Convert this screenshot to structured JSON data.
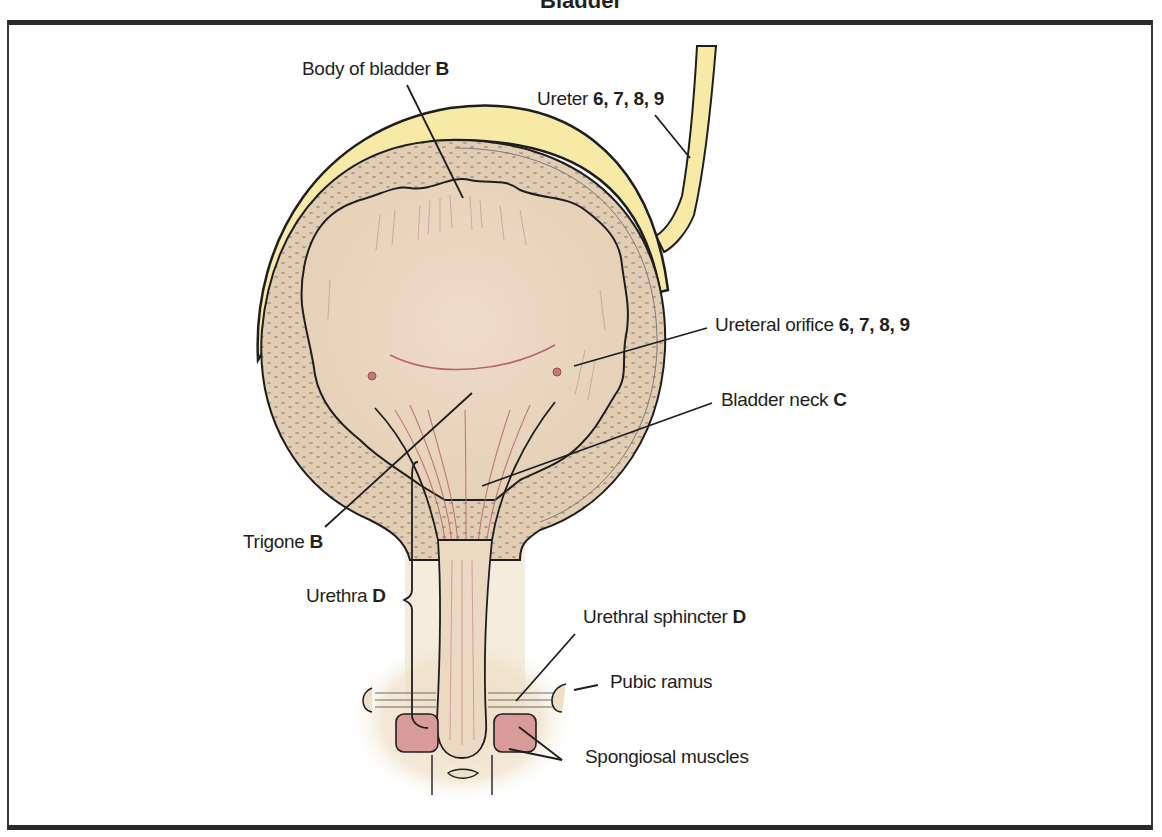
{
  "title": "Bladder",
  "colors": {
    "frame": "#2a2a2a",
    "peritoneum": "#f7e9a6",
    "bladder_wall": "#ead8c3",
    "mucosa": "#efd9c4",
    "muscle_pink": "#d99a9a",
    "line": "#1e1e1e",
    "fiber_red": "#b5646a"
  },
  "labels": [
    {
      "id": "body-of-bladder",
      "text": "Body of bladder ",
      "ref": "B"
    },
    {
      "id": "ureter",
      "text": "Ureter ",
      "ref": "6, 7, 8, 9"
    },
    {
      "id": "ureteral-orifice",
      "text": "Ureteral orifice ",
      "ref": "6, 7, 8, 9"
    },
    {
      "id": "bladder-neck",
      "text": "Bladder neck ",
      "ref": "C"
    },
    {
      "id": "trigone",
      "text": "Trigone ",
      "ref": "B"
    },
    {
      "id": "urethra",
      "text": "Urethra ",
      "ref": "D"
    },
    {
      "id": "urethral-sphincter",
      "text": "Urethral sphincter ",
      "ref": "D"
    },
    {
      "id": "pubic-ramus",
      "text": "Pubic ramus",
      "ref": ""
    },
    {
      "id": "spongiosal-muscles",
      "text": "Spongiosal muscles",
      "ref": ""
    }
  ]
}
